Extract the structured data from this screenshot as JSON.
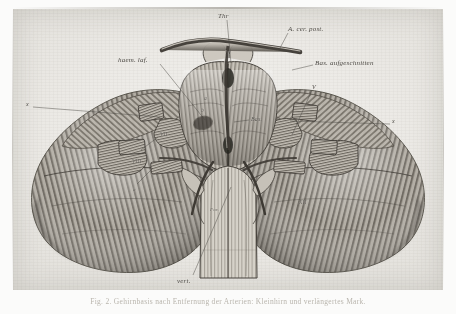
{
  "plate": {
    "title": "Cerebellum and brainstem, basal view",
    "medium": "engraving on paper",
    "paper_color": "#eceae6",
    "ink_color": "#4a4742"
  },
  "labels": [
    {
      "id": "thr",
      "text": "Thr",
      "x": 218,
      "y": 12,
      "class": "sm"
    },
    {
      "id": "acerpost",
      "text": "A. cer. post.",
      "x": 288,
      "y": 25,
      "class": "sm"
    },
    {
      "id": "basauf",
      "text": "Bas. aufgeschnitten",
      "x": 315,
      "y": 59,
      "class": "sm"
    },
    {
      "id": "haemlat",
      "text": "haem. laf.",
      "x": 118,
      "y": 56,
      "class": "sm"
    },
    {
      "id": "bas",
      "text": "Bas.",
      "x": 251,
      "y": 116,
      "class": "xs"
    },
    {
      "id": "vert",
      "text": "vert.",
      "x": 177,
      "y": 277,
      "class": "sm"
    },
    {
      "id": "x-left",
      "text": "x",
      "x": 26,
      "y": 101,
      "class": "xs"
    },
    {
      "id": "x-right",
      "text": "x",
      "x": 392,
      "y": 118,
      "class": "xs"
    },
    {
      "id": "v-right",
      "text": "V",
      "x": 312,
      "y": 84,
      "class": "xs"
    },
    {
      "id": "a-left",
      "text": "a",
      "x": 133,
      "y": 187,
      "class": "tiny"
    },
    {
      "id": "for",
      "text": "For.",
      "x": 210,
      "y": 207,
      "class": "tiny"
    },
    {
      "id": "rom-vii",
      "text": "VII",
      "x": 160,
      "y": 131,
      "class": "rom"
    },
    {
      "id": "rom-viii",
      "text": "VIII",
      "x": 132,
      "y": 158,
      "class": "rom"
    },
    {
      "id": "rom-xii",
      "text": "XII",
      "x": 299,
      "y": 199,
      "class": "rom"
    },
    {
      "id": "rom-a",
      "text": "a",
      "x": 204,
      "y": 95,
      "class": "rom"
    },
    {
      "id": "rom-b",
      "text": "b",
      "x": 201,
      "y": 107,
      "class": "rom"
    }
  ],
  "leaders": [
    {
      "id": "leader-thr",
      "d": "M 227 20 L 231 63"
    },
    {
      "id": "leader-acerpost",
      "d": "M 288 33 L 280 48"
    },
    {
      "id": "leader-basauf",
      "d": "M 313 65 L 292 70"
    },
    {
      "id": "leader-haemlat",
      "d": "M 160 64 L 205 120"
    },
    {
      "id": "leader-bas",
      "d": "M 249 120 L 234 122"
    },
    {
      "id": "leader-vert",
      "d": "M 193 275 L 231 187"
    },
    {
      "id": "leader-xleft",
      "d": "M 33 107 L 160 117"
    },
    {
      "id": "leader-xright",
      "d": "M 390 124 L 290 121"
    },
    {
      "id": "leader-vright",
      "d": "M 312 90 L 292 135"
    },
    {
      "id": "leader-aleft",
      "d": "M 137 184 L 153 168"
    },
    {
      "id": "leader-vii",
      "d": "M 158 137 L 141 150"
    }
  ],
  "caption": {
    "text": "Fig. 2.  Gehirnbasis nach Entfernung der Arterien: Kleinhirn und verlängertes Mark."
  },
  "figure_parts": [
    {
      "name": "cerebellum-left-hemisphere",
      "description": "large folia-striped lobe, left"
    },
    {
      "name": "cerebellum-right-hemisphere",
      "description": "large folia-striped lobe, right"
    },
    {
      "name": "pons",
      "description": "central transverse-fibred body"
    },
    {
      "name": "medulla-oblongata",
      "description": "lower central column"
    },
    {
      "name": "basilar-artery",
      "description": "midline vessel, cut open"
    },
    {
      "name": "posterior-cerebral-artery",
      "description": "upper transverse vessel"
    },
    {
      "name": "vertebral-arteries",
      "description": "paired lower vessels"
    },
    {
      "name": "cranial-nerve-roots",
      "description": "V, VII, VIII, XII stumps"
    }
  ]
}
